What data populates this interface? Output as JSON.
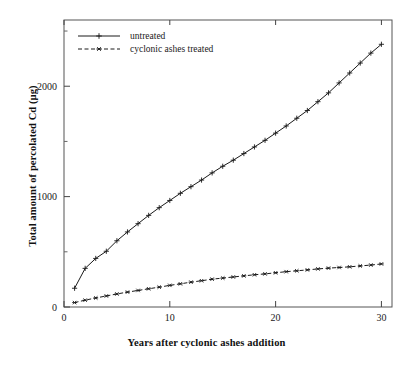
{
  "chart_data": {
    "type": "line",
    "title": "",
    "xlabel": "Years after cyclonic ashes addition",
    "ylabel": "Total amount of percolated Cd (µg)",
    "xlim": [
      0,
      31
    ],
    "ylim": [
      0,
      2600
    ],
    "xticks": [
      0,
      10,
      20,
      30
    ],
    "xtick_labels": [
      "0",
      "10",
      "20",
      "30"
    ],
    "yticks": [
      0,
      1000,
      2000
    ],
    "ytick_labels": [
      "0",
      "1000",
      "2000"
    ],
    "yminor_ticks": [
      500,
      1500,
      2500
    ],
    "grid": false,
    "legend_position": "upper left",
    "x": [
      1,
      2,
      3,
      4,
      5,
      6,
      7,
      8,
      9,
      10,
      11,
      12,
      13,
      14,
      15,
      16,
      17,
      18,
      19,
      20,
      21,
      22,
      23,
      24,
      25,
      26,
      27,
      28,
      29,
      30
    ],
    "series": [
      {
        "name": "untreated",
        "marker": "plus",
        "linestyle": "solid",
        "color": "#1a1a1a",
        "values": [
          170,
          350,
          440,
          505,
          600,
          680,
          755,
          830,
          900,
          965,
          1030,
          1090,
          1150,
          1215,
          1275,
          1330,
          1390,
          1450,
          1510,
          1575,
          1640,
          1710,
          1780,
          1860,
          1940,
          2030,
          2120,
          2210,
          2300,
          2380
        ]
      },
      {
        "name": "cyclonic ashes treated",
        "marker": "star",
        "linestyle": "dashed",
        "color": "#1a1a1a",
        "values": [
          40,
          62,
          82,
          100,
          118,
          135,
          150,
          165,
          180,
          196,
          210,
          225,
          238,
          252,
          262,
          272,
          282,
          292,
          300,
          310,
          320,
          328,
          336,
          345,
          352,
          358,
          364,
          372,
          380,
          390
        ]
      }
    ]
  },
  "legend": {
    "entries": [
      {
        "label": "untreated"
      },
      {
        "label": "cyclonic ashes treated"
      }
    ]
  },
  "axes": {
    "x_title": "Years after cyclonic ashes addition",
    "y_title": "Total amount of percolated Cd (µg)"
  }
}
